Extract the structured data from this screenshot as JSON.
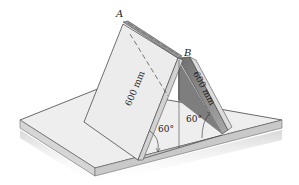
{
  "figure": {
    "points": {
      "A": "A",
      "B": "B"
    },
    "dimensions": {
      "left_plate_length": "600 mm",
      "right_plate_length": "600 mm"
    },
    "angles": {
      "left_angle": "60°",
      "right_angle": "60°"
    },
    "colors": {
      "background": "#ffffff",
      "slab_top": "#ececec",
      "slab_edge": "#cfcfcf",
      "plate_light": "#e9e9e9",
      "plate_shaded": "#8a8a8a",
      "outline": "#333333"
    }
  }
}
